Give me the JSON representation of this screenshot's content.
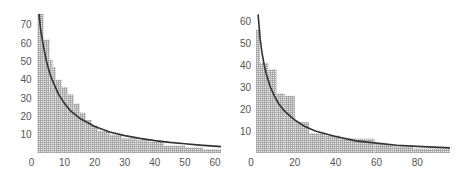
{
  "chart_data": [
    {
      "type": "bar",
      "subtype": "histogram_with_fitted_curve",
      "title": "",
      "xlabel": "",
      "ylabel": "",
      "xlim": [
        0,
        62
      ],
      "ylim": [
        0,
        76
      ],
      "xticks": [
        0,
        10,
        20,
        30,
        40,
        50,
        60
      ],
      "yticks": [
        10,
        20,
        30,
        40,
        50,
        60,
        70
      ],
      "y_zero_label": "0",
      "grid": false,
      "legend": null,
      "bin_width": 2,
      "bins": [
        {
          "x0": 1,
          "x1": 3,
          "value": 76
        },
        {
          "x0": 3,
          "x1": 5,
          "value": 62
        },
        {
          "x0": 5,
          "x1": 6,
          "value": 51
        },
        {
          "x0": 6,
          "x1": 7,
          "value": 47
        },
        {
          "x0": 7,
          "x1": 9,
          "value": 40
        },
        {
          "x0": 9,
          "x1": 11,
          "value": 36
        },
        {
          "x0": 11,
          "x1": 13,
          "value": 32
        },
        {
          "x0": 13,
          "x1": 15,
          "value": 27
        },
        {
          "x0": 15,
          "x1": 17,
          "value": 22
        },
        {
          "x0": 17,
          "x1": 19,
          "value": 18
        },
        {
          "x0": 19,
          "x1": 21,
          "value": 15
        },
        {
          "x0": 21,
          "x1": 25,
          "value": 12
        },
        {
          "x0": 25,
          "x1": 29,
          "value": 10
        },
        {
          "x0": 29,
          "x1": 34,
          "value": 8
        },
        {
          "x0": 34,
          "x1": 38,
          "value": 7
        },
        {
          "x0": 38,
          "x1": 43,
          "value": 6
        },
        {
          "x0": 43,
          "x1": 50,
          "value": 4
        },
        {
          "x0": 50,
          "x1": 56,
          "value": 3
        },
        {
          "x0": 56,
          "x1": 62,
          "value": 2
        }
      ],
      "curve": {
        "name": "fitted power-law curve",
        "x": [
          1.5,
          2,
          3,
          4,
          5,
          6,
          8,
          10,
          12,
          15,
          20,
          25,
          30,
          35,
          40,
          45,
          50,
          55,
          62
        ],
        "y": [
          76,
          68,
          58,
          50,
          44,
          39.5,
          32,
          27,
          23,
          19,
          14.5,
          11.5,
          9.5,
          8,
          6.8,
          5.8,
          5,
          4.3,
          3.5
        ]
      }
    },
    {
      "type": "bar",
      "subtype": "histogram_with_fitted_curve",
      "title": "",
      "xlabel": "",
      "ylabel": "",
      "xlim": [
        0,
        97
      ],
      "ylim": [
        0,
        63
      ],
      "xticks": [
        0,
        20,
        40,
        60,
        80
      ],
      "yticks": [
        10,
        20,
        30,
        40,
        50,
        60
      ],
      "y_zero_label": "0",
      "grid": false,
      "legend": null,
      "bins": [
        {
          "x0": 1,
          "x1": 3,
          "value": 56
        },
        {
          "x0": 3,
          "x1": 7,
          "value": 41
        },
        {
          "x0": 7,
          "x1": 11,
          "value": 38
        },
        {
          "x0": 11,
          "x1": 15,
          "value": 27
        },
        {
          "x0": 15,
          "x1": 20,
          "value": 26
        },
        {
          "x0": 20,
          "x1": 27,
          "value": 14
        },
        {
          "x0": 27,
          "x1": 35,
          "value": 9
        },
        {
          "x0": 35,
          "x1": 42,
          "value": 8
        },
        {
          "x0": 42,
          "x1": 50,
          "value": 6.5
        },
        {
          "x0": 50,
          "x1": 59,
          "value": 6.5
        },
        {
          "x0": 59,
          "x1": 68,
          "value": 4
        },
        {
          "x0": 68,
          "x1": 78,
          "value": 3
        },
        {
          "x0": 78,
          "x1": 88,
          "value": 2
        },
        {
          "x0": 88,
          "x1": 96,
          "value": 2
        }
      ],
      "curve": {
        "name": "fitted power-law curve",
        "x": [
          2,
          3,
          4,
          5,
          6,
          8,
          10,
          12,
          15,
          18,
          20,
          25,
          30,
          40,
          50,
          60,
          70,
          80,
          96
        ],
        "y": [
          63,
          52,
          45,
          40,
          36,
          30,
          26,
          22.5,
          19,
          16.5,
          15,
          12,
          10,
          7.5,
          5.5,
          4.5,
          3.5,
          3,
          2.3
        ]
      }
    }
  ],
  "layout": {
    "panels": [
      {
        "x_px": [
          34.5,
          221
        ],
        "y_px_zero": 153,
        "y_px_per_unit": 1.83
      },
      {
        "x_px": [
          254,
          452
        ],
        "y_px_zero": 153,
        "y_px_per_unit": 2.2
      }
    ],
    "colors": {
      "grid_hatch": "#9a9a9a",
      "bar_fill": "#e8e8e8",
      "curve": "#333333",
      "tick_text": "#555555"
    }
  }
}
